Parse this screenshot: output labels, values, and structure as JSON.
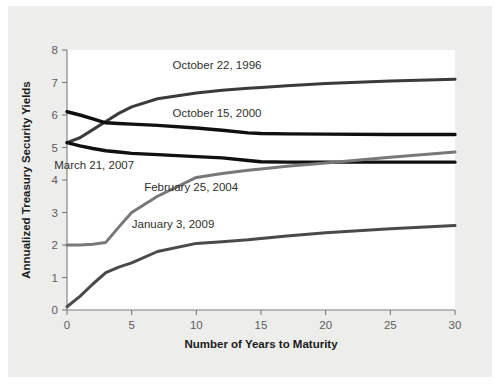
{
  "figure": {
    "background_color": "#ededec",
    "plot_background_color": "#ffffff",
    "axis_color": "#7c7c7c"
  },
  "chart_data": {
    "type": "line",
    "title": "",
    "xlabel": "Number of Years to Maturity",
    "ylabel": "Annualized Treasury Security Yields",
    "xlim": [
      0,
      30
    ],
    "ylim": [
      0,
      8
    ],
    "xticks": [
      0,
      5,
      10,
      15,
      20,
      25,
      30
    ],
    "yticks": [
      0,
      1,
      2,
      3,
      4,
      5,
      6,
      7,
      8
    ],
    "xtick_labels": [
      "0",
      "5",
      "10",
      "15",
      "20",
      "25",
      "30"
    ],
    "ytick_labels": [
      "0",
      "1",
      "2",
      "3",
      "4",
      "5",
      "6",
      "7",
      "8"
    ],
    "grid": false,
    "legend_position": "inline-labels",
    "x": [
      0,
      1,
      2,
      3,
      4,
      5,
      7,
      10,
      12,
      14,
      15,
      17,
      20,
      25,
      30
    ],
    "series": [
      {
        "name": "October 22, 1996",
        "color": "#3b3b3b",
        "width": 3.0,
        "values": [
          5.15,
          5.3,
          5.55,
          5.8,
          6.05,
          6.25,
          6.5,
          6.68,
          6.76,
          6.82,
          6.85,
          6.9,
          6.97,
          7.05,
          7.1
        ],
        "label_x": 11.6,
        "label_y": 7.42
      },
      {
        "name": "October 15, 2000",
        "color": "#101010",
        "width": 3.4,
        "values": [
          6.1,
          6.0,
          5.88,
          5.76,
          5.74,
          5.72,
          5.68,
          5.6,
          5.53,
          5.45,
          5.43,
          5.42,
          5.41,
          5.4,
          5.4
        ],
        "label_x": 11.6,
        "label_y": 5.93
      },
      {
        "name": "March 21, 2007",
        "color": "#101010",
        "width": 3.4,
        "values": [
          5.15,
          5.05,
          4.97,
          4.9,
          4.86,
          4.82,
          4.78,
          4.72,
          4.68,
          4.6,
          4.56,
          4.55,
          4.55,
          4.55,
          4.55
        ],
        "label_x": 2.1,
        "label_y": 4.33
      },
      {
        "name": "February 25, 2004",
        "color": "#787878",
        "width": 3.0,
        "values": [
          2.0,
          2.0,
          2.02,
          2.08,
          2.55,
          3.0,
          3.5,
          4.08,
          4.2,
          4.3,
          4.34,
          4.42,
          4.52,
          4.7,
          4.86
        ],
        "label_x": 9.6,
        "label_y": 3.65
      },
      {
        "name": "January 3, 2009",
        "color": "#4a4a4a",
        "width": 3.0,
        "values": [
          0.1,
          0.42,
          0.8,
          1.15,
          1.32,
          1.45,
          1.8,
          2.05,
          2.1,
          2.16,
          2.2,
          2.28,
          2.38,
          2.5,
          2.6
        ],
        "label_x": 8.2,
        "label_y": 2.52
      }
    ]
  }
}
